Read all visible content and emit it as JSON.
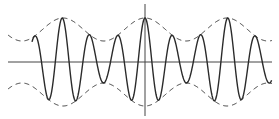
{
  "figure": {
    "colors": {
      "wave": "#2b2b2b",
      "envelope": "#3a3a3a",
      "axis": "#444444",
      "background": "#ffffff"
    },
    "axes": {
      "x_axis_y": 62,
      "x_start": 8,
      "x_end": 272,
      "y_axis_x": 145,
      "y_start": 4,
      "y_end": 116
    },
    "carrier": {
      "period_px": 27.6,
      "peak_x": 145
    },
    "envelope": {
      "period_px": 82,
      "peak_x": 145,
      "max_amp_px": 44,
      "min_amp_px": 21
    }
  }
}
